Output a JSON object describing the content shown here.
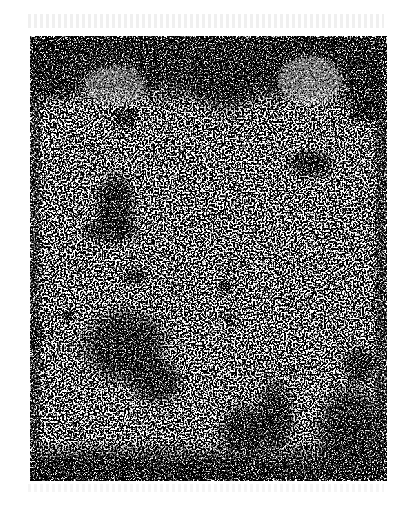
{
  "document": {
    "type": "scanned-page",
    "description": "High-contrast black and white scan of a degraded document page; content illegible",
    "visible_text": [],
    "colors": {
      "ink": "#000000",
      "paper": "#ffffff"
    },
    "scan_bounds": {
      "left": 30,
      "top": 36,
      "width": 357,
      "height": 445
    }
  }
}
